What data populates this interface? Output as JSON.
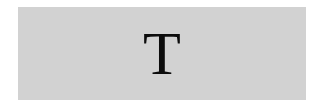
{
  "tile": {
    "letter": "T",
    "background_color": "#d2d2d2",
    "text_color": "#0c0c0c"
  }
}
